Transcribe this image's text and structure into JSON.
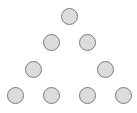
{
  "diagram": {
    "type": "triangle-of-circles",
    "colors": {
      "fill": "#dcdcdc",
      "stroke": "#7a7a7a",
      "background": "#ffffff"
    },
    "nodes": [
      {
        "x": 69,
        "y": 16
      },
      {
        "x": 51,
        "y": 42
      },
      {
        "x": 87,
        "y": 42
      },
      {
        "x": 33,
        "y": 69
      },
      {
        "x": 105,
        "y": 69
      },
      {
        "x": 15,
        "y": 95
      },
      {
        "x": 51,
        "y": 95
      },
      {
        "x": 87,
        "y": 95
      },
      {
        "x": 123,
        "y": 95
      }
    ]
  }
}
